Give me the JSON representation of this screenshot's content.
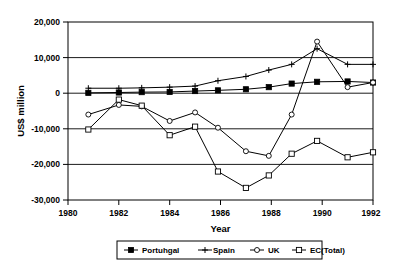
{
  "chart_data": {
    "type": "line",
    "title": "",
    "xlabel": "Year",
    "ylabel": "US$ million",
    "xlim": [
      1980,
      1992
    ],
    "ylim": [
      -30000,
      20000
    ],
    "grid": true,
    "legend_position": "bottom",
    "xticks": [
      "1980",
      "1982",
      "1984",
      "1986",
      "1988",
      "1990",
      "1992"
    ],
    "xtick_values": [
      1980,
      1982,
      1984,
      1986,
      1988,
      1990,
      1992
    ],
    "yticks": [
      "20,000",
      "10,000",
      "0",
      "-10,000",
      "-20,000",
      "-30,000"
    ],
    "ytick_values": [
      20000,
      10000,
      0,
      -10000,
      -20000,
      -30000
    ],
    "x": [
      1980.8,
      1982.0,
      1982.9,
      1984.0,
      1985.0,
      1985.9,
      1987.0,
      1987.9,
      1988.8,
      1989.8,
      1991.0,
      1992.0
    ],
    "series": [
      {
        "name": "Portuhgal",
        "marker": "filled-square",
        "values": [
          100,
          200,
          300,
          350,
          600,
          800,
          1100,
          1700,
          2700,
          3200,
          3300,
          3000
        ]
      },
      {
        "name": "Spain",
        "marker": "plus",
        "values": [
          1400,
          1400,
          1500,
          1700,
          2000,
          3500,
          4700,
          6500,
          8100,
          12500,
          8100,
          8100
        ]
      },
      {
        "name": "UK",
        "marker": "open-circle",
        "values": [
          -6000,
          -3300,
          -3700,
          -7800,
          -5400,
          -9700,
          -16300,
          -17600,
          -6000,
          14500,
          1700,
          3000
        ]
      },
      {
        "name": "EC(Total)",
        "marker": "open-square",
        "values": [
          -10200,
          -1800,
          -3500,
          -11800,
          -9400,
          -22000,
          -26600,
          -23100,
          -17000,
          -13400,
          -18000,
          -16600
        ]
      }
    ]
  },
  "legend": {
    "items": [
      {
        "label": "Portuhgal",
        "marker": "filled-square"
      },
      {
        "label": "Spain",
        "marker": "plus"
      },
      {
        "label": "UK",
        "marker": "open-circle"
      },
      {
        "label": "EC(Total)",
        "marker": "open-square"
      }
    ]
  }
}
